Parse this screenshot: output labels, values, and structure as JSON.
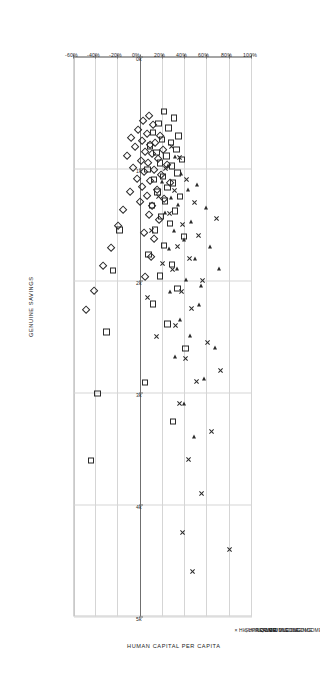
{
  "chart_data": {
    "type": "scatter",
    "title": "",
    "xlabel": "HUMAN CAPITAL PER CAPITA",
    "ylabel": "GENUINE SAVINGS",
    "xlim": [
      0,
      5000
    ],
    "ylim": [
      -60,
      100
    ],
    "x_ticks": [
      0,
      1000,
      2000,
      3000,
      4000,
      5000
    ],
    "x_tick_labels": [
      "0k",
      "1k",
      "2k",
      "3k",
      "4k",
      "5k"
    ],
    "y_ticks": [
      -60,
      -40,
      -20,
      0,
      20,
      40,
      60,
      80,
      100
    ],
    "y_tick_labels": [
      "-60%",
      "-40%",
      "-20%",
      "0%",
      "20%",
      "40%",
      "60%",
      "80%",
      "100%"
    ],
    "grid": true,
    "legend_position": "above-plot",
    "legend": [
      {
        "label": "LOW INCOME",
        "marker": "diamond",
        "symbol": "◇"
      },
      {
        "label": "LOWER MIDDLE INCOME",
        "marker": "square",
        "symbol": "□"
      },
      {
        "label": "UPPER MIDDLE INCOME",
        "marker": "triangle",
        "symbol": "◁"
      },
      {
        "label": "HIGH INCOME",
        "marker": "x",
        "symbol": "×"
      }
    ],
    "series": [
      {
        "name": "LOW INCOME",
        "marker": "diamond",
        "points": [
          [
            520,
            8
          ],
          [
            560,
            3
          ],
          [
            600,
            12
          ],
          [
            640,
            -2
          ],
          [
            680,
            6
          ],
          [
            700,
            18
          ],
          [
            720,
            -8
          ],
          [
            740,
            2
          ],
          [
            760,
            14
          ],
          [
            780,
            9
          ],
          [
            800,
            -4
          ],
          [
            820,
            21
          ],
          [
            840,
            5
          ],
          [
            860,
            11
          ],
          [
            880,
            -12
          ],
          [
            900,
            16
          ],
          [
            920,
            1
          ],
          [
            940,
            7
          ],
          [
            960,
            24
          ],
          [
            980,
            -6
          ],
          [
            1000,
            13
          ],
          [
            1020,
            4
          ],
          [
            1050,
            19
          ],
          [
            1080,
            -3
          ],
          [
            1100,
            9
          ],
          [
            1120,
            27
          ],
          [
            1150,
            2
          ],
          [
            1180,
            15
          ],
          [
            1200,
            -9
          ],
          [
            1230,
            6
          ],
          [
            1260,
            22
          ],
          [
            1290,
            0
          ],
          [
            1320,
            11
          ],
          [
            1360,
            -15
          ],
          [
            1400,
            8
          ],
          [
            1450,
            17
          ],
          [
            1500,
            -20
          ],
          [
            1560,
            4
          ],
          [
            1620,
            13
          ],
          [
            1700,
            -26
          ],
          [
            1780,
            10
          ],
          [
            1860,
            -33
          ],
          [
            1960,
            5
          ],
          [
            2080,
            -41
          ],
          [
            2250,
            -48
          ]
        ]
      },
      {
        "name": "LOWER MIDDLE INCOME",
        "marker": "square",
        "points": [
          [
            480,
            22
          ],
          [
            540,
            31
          ],
          [
            590,
            17
          ],
          [
            630,
            26
          ],
          [
            670,
            12
          ],
          [
            700,
            35
          ],
          [
            730,
            20
          ],
          [
            760,
            28
          ],
          [
            790,
            9
          ],
          [
            820,
            33
          ],
          [
            850,
            15
          ],
          [
            880,
            24
          ],
          [
            910,
            38
          ],
          [
            940,
            18
          ],
          [
            970,
            29
          ],
          [
            1000,
            7
          ],
          [
            1030,
            34
          ],
          [
            1060,
            21
          ],
          [
            1090,
            13
          ],
          [
            1120,
            30
          ],
          [
            1160,
            25
          ],
          [
            1200,
            16
          ],
          [
            1240,
            36
          ],
          [
            1280,
            23
          ],
          [
            1320,
            11
          ],
          [
            1370,
            32
          ],
          [
            1420,
            19
          ],
          [
            1480,
            27
          ],
          [
            1540,
            14
          ],
          [
            1600,
            40
          ],
          [
            1680,
            22
          ],
          [
            1760,
            8
          ],
          [
            1850,
            29
          ],
          [
            1950,
            18
          ],
          [
            2060,
            34
          ],
          [
            2200,
            12
          ],
          [
            2380,
            25
          ],
          [
            2600,
            41
          ],
          [
            2900,
            5
          ],
          [
            3250,
            30
          ],
          [
            1540,
            -18
          ],
          [
            1900,
            -24
          ],
          [
            2450,
            -30
          ],
          [
            3000,
            -38
          ],
          [
            3600,
            -44
          ]
        ]
      },
      {
        "name": "UPPER MIDDLE INCOME",
        "marker": "triangle",
        "points": [
          [
            900,
            30
          ],
          [
            980,
            24
          ],
          [
            1050,
            36
          ],
          [
            1120,
            19
          ],
          [
            1190,
            42
          ],
          [
            1260,
            27
          ],
          [
            1330,
            33
          ],
          [
            1400,
            21
          ],
          [
            1480,
            45
          ],
          [
            1560,
            29
          ],
          [
            1640,
            38
          ],
          [
            1720,
            25
          ],
          [
            1810,
            48
          ],
          [
            1900,
            32
          ],
          [
            2000,
            40
          ],
          [
            2100,
            26
          ],
          [
            2220,
            52
          ],
          [
            2350,
            35
          ],
          [
            2500,
            44
          ],
          [
            2680,
            30
          ],
          [
            2880,
            56
          ],
          [
            3100,
            38
          ],
          [
            3400,
            47
          ],
          [
            1350,
            58
          ],
          [
            1700,
            62
          ],
          [
            2050,
            54
          ],
          [
            2600,
            66
          ],
          [
            1150,
            50
          ],
          [
            1900,
            70
          ]
        ]
      },
      {
        "name": "HIGH INCOME",
        "marker": "x",
        "points": [
          [
            800,
            28
          ],
          [
            900,
            35
          ],
          [
            1000,
            22
          ],
          [
            1100,
            41
          ],
          [
            1200,
            30
          ],
          [
            1300,
            48
          ],
          [
            1400,
            26
          ],
          [
            1500,
            38
          ],
          [
            1600,
            52
          ],
          [
            1700,
            33
          ],
          [
            1800,
            44
          ],
          [
            1900,
            29
          ],
          [
            2000,
            56
          ],
          [
            2100,
            37
          ],
          [
            2250,
            46
          ],
          [
            2400,
            31
          ],
          [
            2550,
            60
          ],
          [
            2700,
            40
          ],
          [
            2900,
            50
          ],
          [
            3100,
            35
          ],
          [
            3350,
            64
          ],
          [
            3600,
            43
          ],
          [
            3900,
            55
          ],
          [
            4250,
            38
          ],
          [
            4600,
            47
          ],
          [
            1250,
            16
          ],
          [
            1550,
            10
          ],
          [
            1850,
            20
          ],
          [
            2150,
            6
          ],
          [
            2500,
            14
          ],
          [
            1450,
            68
          ],
          [
            2800,
            72
          ],
          [
            4400,
            80
          ]
        ]
      }
    ]
  }
}
